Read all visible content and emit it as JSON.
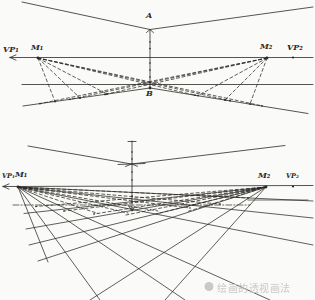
{
  "colors": {
    "ink": "#2b2926",
    "paper": "#fafaf8",
    "watermark": "#c9c9c7"
  },
  "top_diagram": {
    "labels": {
      "a": "A",
      "b": "B",
      "vp1": "VP₁",
      "m1": "M₁",
      "m2": "M₂",
      "vp2": "VP₂"
    }
  },
  "bottom_diagram": {
    "labels": {
      "vp1": "VP₁",
      "m1": "M₁",
      "m2": "M₂",
      "vp2": "VP₂"
    }
  },
  "watermark": {
    "icon": "circle-logo",
    "text": "绘画的透视画法"
  }
}
